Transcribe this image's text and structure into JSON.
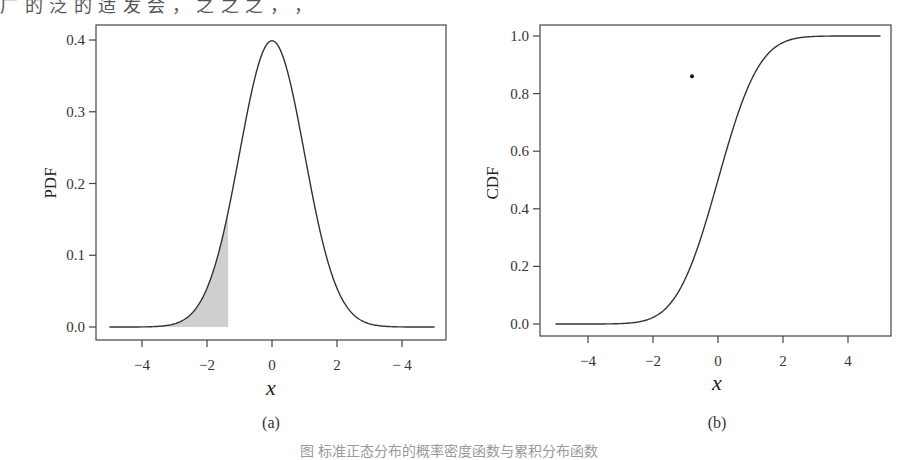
{
  "page": {
    "top_fragment": "广 的 泛 的 适 发 会 ，   之 之 之 ，  ，",
    "bottom_caption": "图  标准正态分布的概率密度函数与累积分布函数"
  },
  "chart_data": [
    {
      "id": "pdf",
      "type": "line",
      "panel_label": "(a)",
      "title": "",
      "xlabel": "x",
      "ylabel": "PDF",
      "function": "standard_normal_pdf",
      "x_range": [
        -5,
        5
      ],
      "xlim": [
        -5.3,
        5.5
      ],
      "ylim": [
        -0.03,
        0.42
      ],
      "x_ticks": [
        -4,
        -2,
        0,
        2,
        4
      ],
      "x_tick_labels": [
        "−4",
        "−2",
        "0",
        "2",
        "− 4"
      ],
      "y_ticks": [
        0.0,
        0.1,
        0.2,
        0.3,
        0.4
      ],
      "y_tick_labels": [
        "0.0",
        "0.1",
        "0.2",
        "0.3",
        "0.4"
      ],
      "shaded_region": {
        "from": -5,
        "to": -1.35,
        "fill": "#cfcfcf"
      },
      "sample_points": {
        "x": [
          -4,
          -3,
          -2,
          -1.35,
          -1,
          0,
          1,
          2,
          3,
          4
        ],
        "y": [
          0.0001,
          0.0044,
          0.054,
          0.16,
          0.242,
          0.399,
          0.242,
          0.054,
          0.0044,
          0.0001
        ]
      },
      "grid": false,
      "line_color": "#333333"
    },
    {
      "id": "cdf",
      "type": "line",
      "panel_label": "(b)",
      "title": "",
      "xlabel": "x",
      "ylabel": "CDF",
      "function": "standard_normal_cdf",
      "x_range": [
        -5,
        5
      ],
      "xlim": [
        -5.5,
        5.4
      ],
      "ylim": [
        -0.04,
        1.04
      ],
      "x_ticks": [
        -4,
        -2,
        0,
        2,
        4
      ],
      "x_tick_labels": [
        "−4",
        "−2",
        "0",
        "2",
        "4"
      ],
      "y_ticks": [
        0.0,
        0.2,
        0.4,
        0.6,
        0.8,
        1.0
      ],
      "y_tick_labels": [
        "0.0",
        "0.2",
        "0.4",
        "0.6",
        "0.8",
        "1.0"
      ],
      "annotation_dot": {
        "x": -0.8,
        "y": 0.86
      },
      "sample_points": {
        "x": [
          -4,
          -3,
          -2,
          -1,
          0,
          1,
          2,
          3,
          4
        ],
        "y": [
          3e-05,
          0.0013,
          0.0228,
          0.1587,
          0.5,
          0.8413,
          0.9772,
          0.9987,
          0.99997
        ]
      },
      "grid": false,
      "line_color": "#333333"
    }
  ],
  "layout": {
    "panels": [
      {
        "box": [
          96,
          25,
          446,
          340
        ],
        "x0px": 272,
        "xscale": 32.5,
        "y0px": 327,
        "yscale": 717.5,
        "ylabel_pos": [
          56,
          183
        ],
        "xlabel_pos": [
          271,
          395
        ],
        "panel_pos": [
          271,
          428
        ]
      },
      {
        "box": [
          540,
          25,
          891,
          336
        ],
        "x0px": 718,
        "xscale": 32.5,
        "y0px": 324,
        "yscale": 288,
        "ylabel_pos": [
          498,
          183
        ],
        "xlabel_pos": [
          717,
          390
        ],
        "panel_pos": [
          717,
          428
        ]
      }
    ]
  }
}
